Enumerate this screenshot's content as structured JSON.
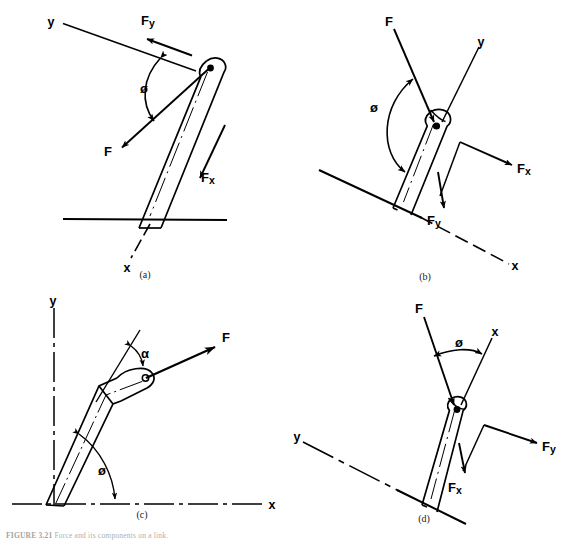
{
  "figure": {
    "background_color": "#ffffff",
    "ink_color": "#000000",
    "caption_prefix": "FIGURE 3.21",
    "caption_text": "Force and its components on a link."
  },
  "panels": [
    {
      "id": "a",
      "panel_label": "(a)",
      "labels": {
        "axis_y": "y",
        "axis_x": "x",
        "force": "F",
        "force_x": "Fx",
        "force_y": "Fy",
        "angle_phi": "ø"
      }
    },
    {
      "id": "b",
      "panel_label": "(b)",
      "labels": {
        "axis_y": "y",
        "axis_x": "x",
        "force": "F",
        "force_x": "Fx",
        "force_y": "Fy",
        "angle_phi": "ø"
      }
    },
    {
      "id": "c",
      "panel_label": "(c)",
      "labels": {
        "axis_y": "y",
        "axis_x": "x",
        "force": "F",
        "angle_alpha": "α",
        "angle_phi": "ø"
      }
    },
    {
      "id": "d",
      "panel_label": "(d)",
      "labels": {
        "axis_y": "y",
        "axis_x": "x",
        "force": "F",
        "force_x": "Fx",
        "force_y": "Fy",
        "angle_phi": "ø"
      }
    }
  ]
}
